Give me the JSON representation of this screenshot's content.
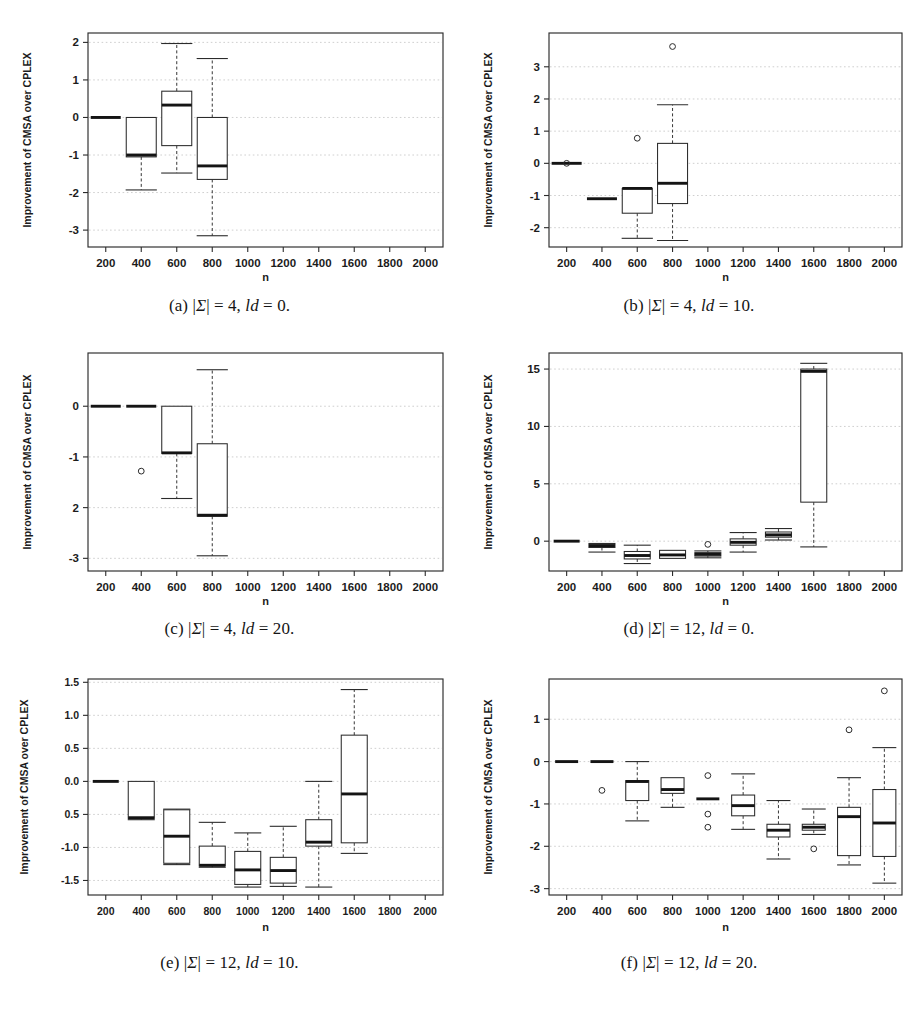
{
  "figure": {
    "y_axis_label": "Improvement of CMSA over CPLEX",
    "x_axis_label": "n",
    "panels": [
      {
        "id": "a",
        "caption_prefix": "(a)",
        "caption_body": "|Σ| = 4, ld = 0.",
        "alphabet": 4,
        "ld": 0,
        "ylabel": "Improvement of CMSA over CPLEX",
        "xlabel": "n",
        "yticks": [
          2,
          1,
          0,
          -1,
          -2,
          -3
        ],
        "yticklabels": [
          "2",
          "1",
          "0",
          "-1",
          "-2",
          "-3"
        ],
        "ylim": [
          -3.45,
          2.25
        ],
        "xticks": [
          200,
          400,
          600,
          800,
          1000,
          1200,
          1400,
          1600,
          1800,
          2000
        ],
        "xticklabels": [
          "200",
          "400",
          "600",
          "800",
          "1000",
          "1200",
          "1400",
          "1600",
          "1800",
          "2000"
        ]
      },
      {
        "id": "b",
        "caption_prefix": "(b)",
        "caption_body": "|Σ| = 4, ld = 10.",
        "alphabet": 4,
        "ld": 10,
        "ylabel": "Improvement of CMSA over CPLEX",
        "xlabel": "n",
        "yticks": [
          3,
          2,
          1,
          0,
          -1,
          -2
        ],
        "yticklabels": [
          "3",
          "2",
          "1",
          "0",
          "-1",
          "-2"
        ],
        "ylim": [
          -2.6,
          4.05
        ],
        "xticks": [
          200,
          400,
          600,
          800,
          1000,
          1200,
          1400,
          1600,
          1800,
          2000
        ],
        "xticklabels": [
          "200",
          "400",
          "600",
          "800",
          "1000",
          "1200",
          "1400",
          "1600",
          "1800",
          "2000"
        ]
      },
      {
        "id": "c",
        "caption_prefix": "(c)",
        "caption_body": "|Σ| = 4, ld = 20.",
        "alphabet": 4,
        "ld": 20,
        "ylabel": "Improvement of CMSA over CPLEX",
        "xlabel": "n",
        "yticks": [
          0,
          -1,
          -2,
          -3
        ],
        "yticklabels": [
          "0",
          "-1",
          "2",
          "-3"
        ],
        "ylim": [
          -3.25,
          1.05
        ],
        "xticks": [
          200,
          400,
          600,
          800,
          1000,
          1200,
          1400,
          1600,
          1800,
          2000
        ],
        "xticklabels": [
          "200",
          "400",
          "600",
          "800",
          "1000",
          "1200",
          "1400",
          "1600",
          "1800",
          "2000"
        ]
      },
      {
        "id": "d",
        "caption_prefix": "(d)",
        "caption_body": "|Σ| = 12, ld = 0.",
        "alphabet": 12,
        "ld": 0,
        "ylabel": "Improvement of CMSA over CPLEX",
        "xlabel": "n",
        "yticks": [
          15,
          10,
          5,
          0
        ],
        "yticklabels": [
          "15",
          "10",
          "5",
          "0"
        ],
        "ylim": [
          -2.6,
          16.4
        ],
        "xticks": [
          200,
          400,
          600,
          800,
          1000,
          1200,
          1400,
          1600,
          1800,
          2000
        ],
        "xticklabels": [
          "200",
          "400",
          "600",
          "800",
          "1000",
          "1200",
          "1400",
          "1600",
          "1800",
          "2000"
        ]
      },
      {
        "id": "e",
        "caption_prefix": "(e)",
        "caption_body": "|Σ| = 12, ld = 10.",
        "alphabet": 12,
        "ld": 10,
        "ylabel": "Improvement of CMSA over CPLEX",
        "xlabel": "n",
        "yticks": [
          1.5,
          1.0,
          0.5,
          0.0,
          -0.5,
          -1.0,
          -1.5
        ],
        "yticklabels": [
          "1.5",
          "1.0",
          "0.5",
          "0.0",
          "0.5",
          "-1.0",
          "-1.5"
        ],
        "ylim": [
          -1.72,
          1.55
        ],
        "xticks": [
          200,
          400,
          600,
          800,
          1000,
          1200,
          1400,
          1600,
          1800,
          2000
        ],
        "xticklabels": [
          "200",
          "400",
          "600",
          "800",
          "1000",
          "1200",
          "1400",
          "1600",
          "1800",
          "2000"
        ]
      },
      {
        "id": "f",
        "caption_prefix": "(f)",
        "caption_body": "|Σ| = 12, ld = 20.",
        "alphabet": 12,
        "ld": 20,
        "ylabel": "Improvement of CMSA over CPLEX",
        "xlabel": "n",
        "yticks": [
          1,
          0,
          -1,
          -2,
          -3
        ],
        "yticklabels": [
          "1",
          "0",
          "-1",
          "-2",
          "-3"
        ],
        "ylim": [
          -3.15,
          1.95
        ],
        "xticks": [
          200,
          400,
          600,
          800,
          1000,
          1200,
          1400,
          1600,
          1800,
          2000
        ],
        "xticklabels": [
          "200",
          "400",
          "600",
          "800",
          "1000",
          "1200",
          "1400",
          "1600",
          "1800",
          "2000"
        ]
      }
    ]
  },
  "chart_data": [
    {
      "type": "box",
      "panel": "a",
      "title": "(a) |Σ| = 4, ld = 0.",
      "xlabel": "n",
      "ylabel": "Improvement of CMSA over CPLEX",
      "ylim": [
        -3.45,
        2.25
      ],
      "xlim": [
        100,
        2100
      ],
      "grid": true,
      "categories": [
        200,
        400,
        600,
        800
      ],
      "boxes": [
        {
          "x": 200,
          "whisker_low": 0.0,
          "q1": 0.0,
          "median": 0.0,
          "q3": 0.0,
          "whisker_high": 0.0,
          "outliers": []
        },
        {
          "x": 400,
          "whisker_low": -1.93,
          "q1": -1.05,
          "median": -1.0,
          "q3": 0.0,
          "whisker_high": 0.0,
          "outliers": []
        },
        {
          "x": 600,
          "whisker_low": -1.48,
          "q1": -0.75,
          "median": 0.33,
          "q3": 0.7,
          "whisker_high": 1.97,
          "outliers": []
        },
        {
          "x": 800,
          "whisker_low": -3.15,
          "q1": -1.65,
          "median": -1.29,
          "q3": 0.0,
          "whisker_high": 1.57,
          "outliers": []
        }
      ]
    },
    {
      "type": "box",
      "panel": "b",
      "title": "(b) |Σ| = 4, ld = 10.",
      "xlabel": "n",
      "ylabel": "Improvement of CMSA over CPLEX",
      "ylim": [
        -2.6,
        4.05
      ],
      "xlim": [
        100,
        2100
      ],
      "grid": true,
      "categories": [
        200,
        400,
        600,
        800
      ],
      "boxes": [
        {
          "x": 200,
          "whisker_low": 0.0,
          "q1": 0.0,
          "median": 0.0,
          "q3": 0.0,
          "whisker_high": 0.0,
          "outliers": [
            0.0
          ]
        },
        {
          "x": 400,
          "whisker_low": -1.1,
          "q1": -1.1,
          "median": -1.1,
          "q3": -1.1,
          "whisker_high": -1.1,
          "outliers": []
        },
        {
          "x": 600,
          "whisker_low": -2.33,
          "q1": -1.55,
          "median": -0.78,
          "q3": -0.78,
          "whisker_high": -0.78,
          "outliers": [
            0.78
          ]
        },
        {
          "x": 800,
          "whisker_low": -2.4,
          "q1": -1.25,
          "median": -0.62,
          "q3": 0.62,
          "whisker_high": 1.82,
          "outliers": [
            3.63
          ]
        }
      ]
    },
    {
      "type": "box",
      "panel": "c",
      "title": "(c) |Σ| = 4, ld = 20.",
      "xlabel": "n",
      "ylabel": "Improvement of CMSA over CPLEX",
      "ylim": [
        -3.25,
        1.05
      ],
      "xlim": [
        100,
        2100
      ],
      "grid": true,
      "categories": [
        200,
        400,
        600,
        800
      ],
      "boxes": [
        {
          "x": 200,
          "whisker_low": 0.0,
          "q1": 0.0,
          "median": 0.0,
          "q3": 0.0,
          "whisker_high": 0.0,
          "outliers": []
        },
        {
          "x": 400,
          "whisker_low": 0.0,
          "q1": 0.0,
          "median": 0.0,
          "q3": 0.0,
          "whisker_high": 0.0,
          "outliers": [
            -1.28
          ]
        },
        {
          "x": 600,
          "whisker_low": -1.82,
          "q1": -0.93,
          "median": -0.92,
          "q3": 0.0,
          "whisker_high": 0.0,
          "outliers": []
        },
        {
          "x": 800,
          "whisker_low": -2.95,
          "q1": -2.17,
          "median": -2.15,
          "q3": -0.74,
          "whisker_high": 0.72,
          "outliers": []
        }
      ]
    },
    {
      "type": "box",
      "panel": "d",
      "title": "(d) |Σ| = 12, ld = 0.",
      "xlabel": "n",
      "ylabel": "Improvement of CMSA over CPLEX",
      "ylim": [
        -2.6,
        16.4
      ],
      "xlim": [
        100,
        2100
      ],
      "grid": true,
      "categories": [
        200,
        400,
        600,
        800,
        1000,
        1200,
        1400,
        1600
      ],
      "boxes": [
        {
          "x": 200,
          "whisker_low": 0.0,
          "q1": 0.0,
          "median": 0.0,
          "q3": 0.0,
          "whisker_high": 0.0,
          "outliers": []
        },
        {
          "x": 400,
          "whisker_low": -0.95,
          "q1": -0.55,
          "median": -0.38,
          "q3": -0.2,
          "whisker_high": -0.2,
          "outliers": []
        },
        {
          "x": 600,
          "whisker_low": -1.95,
          "q1": -1.55,
          "median": -1.25,
          "q3": -0.9,
          "whisker_high": -0.35,
          "outliers": []
        },
        {
          "x": 800,
          "whisker_low": -1.55,
          "q1": -1.5,
          "median": -1.2,
          "q3": -0.8,
          "whisker_high": -0.8,
          "outliers": []
        },
        {
          "x": 1000,
          "whisker_low": -1.45,
          "q1": -1.3,
          "median": -1.15,
          "q3": -1.0,
          "whisker_high": -0.85,
          "outliers": [
            -0.28
          ]
        },
        {
          "x": 1200,
          "whisker_low": -0.95,
          "q1": -0.35,
          "median": -0.1,
          "q3": 0.2,
          "whisker_high": 0.75,
          "outliers": []
        },
        {
          "x": 1400,
          "whisker_low": 0.1,
          "q1": 0.35,
          "median": 0.55,
          "q3": 0.8,
          "whisker_high": 1.1,
          "outliers": []
        },
        {
          "x": 1600,
          "whisker_low": -0.5,
          "q1": 3.4,
          "median": 14.8,
          "q3": 15.0,
          "whisker_high": 15.5,
          "outliers": []
        }
      ]
    },
    {
      "type": "box",
      "panel": "e",
      "title": "(e) |Σ| = 12, ld = 10.",
      "xlabel": "n",
      "ylabel": "Improvement of CMSA over CPLEX",
      "ylim": [
        -1.72,
        1.55
      ],
      "xlim": [
        100,
        2100
      ],
      "grid": true,
      "categories": [
        200,
        400,
        600,
        800,
        1000,
        1200,
        1400,
        1600
      ],
      "boxes": [
        {
          "x": 200,
          "whisker_low": 0.0,
          "q1": 0.0,
          "median": 0.0,
          "q3": 0.0,
          "whisker_high": 0.0,
          "outliers": []
        },
        {
          "x": 400,
          "whisker_low": -0.58,
          "q1": -0.56,
          "median": -0.55,
          "q3": 0.0,
          "whisker_high": 0.0,
          "outliers": []
        },
        {
          "x": 600,
          "whisker_low": -1.26,
          "q1": -1.24,
          "median": -0.83,
          "q3": -0.43,
          "whisker_high": -0.42,
          "outliers": []
        },
        {
          "x": 800,
          "whisker_low": -1.3,
          "q1": -1.28,
          "median": -1.27,
          "q3": -0.98,
          "whisker_high": -0.62,
          "outliers": []
        },
        {
          "x": 1000,
          "whisker_low": -1.6,
          "q1": -1.56,
          "median": -1.34,
          "q3": -1.06,
          "whisker_high": -0.78,
          "outliers": []
        },
        {
          "x": 1200,
          "whisker_low": -1.59,
          "q1": -1.54,
          "median": -1.35,
          "q3": -1.15,
          "whisker_high": -0.68,
          "outliers": []
        },
        {
          "x": 1400,
          "whisker_low": -1.6,
          "q1": -0.98,
          "median": -0.92,
          "q3": -0.58,
          "whisker_high": 0.0,
          "outliers": []
        },
        {
          "x": 1600,
          "whisker_low": -1.09,
          "q1": -0.93,
          "median": -0.19,
          "q3": 0.7,
          "whisker_high": 1.39,
          "outliers": []
        }
      ]
    },
    {
      "type": "box",
      "panel": "f",
      "title": "(f) |Σ| = 12, ld = 20.",
      "xlabel": "n",
      "ylabel": "Improvement of CMSA over CPLEX",
      "ylim": [
        -3.15,
        1.95
      ],
      "xlim": [
        100,
        2100
      ],
      "grid": true,
      "categories": [
        200,
        400,
        600,
        800,
        1000,
        1200,
        1400,
        1600,
        1800,
        2000
      ],
      "boxes": [
        {
          "x": 200,
          "whisker_low": 0.0,
          "q1": 0.0,
          "median": 0.0,
          "q3": 0.0,
          "whisker_high": 0.0,
          "outliers": []
        },
        {
          "x": 400,
          "whisker_low": 0.0,
          "q1": 0.0,
          "median": 0.0,
          "q3": 0.0,
          "whisker_high": 0.0,
          "outliers": [
            -0.68
          ]
        },
        {
          "x": 600,
          "whisker_low": -1.4,
          "q1": -0.92,
          "median": -0.47,
          "q3": -0.45,
          "whisker_high": 0.0,
          "outliers": []
        },
        {
          "x": 800,
          "whisker_low": -1.08,
          "q1": -0.75,
          "median": -0.66,
          "q3": -0.38,
          "whisker_high": -0.38,
          "outliers": []
        },
        {
          "x": 1000,
          "whisker_low": -0.88,
          "q1": -0.88,
          "median": -0.88,
          "q3": -0.88,
          "whisker_high": -0.88,
          "outliers": [
            -0.33,
            -1.24,
            -1.55
          ]
        },
        {
          "x": 1200,
          "whisker_low": -1.6,
          "q1": -1.28,
          "median": -1.04,
          "q3": -0.79,
          "whisker_high": -0.29,
          "outliers": []
        },
        {
          "x": 1400,
          "whisker_low": -2.3,
          "q1": -1.78,
          "median": -1.62,
          "q3": -1.48,
          "whisker_high": -0.92,
          "outliers": []
        },
        {
          "x": 1600,
          "whisker_low": -1.72,
          "q1": -1.62,
          "median": -1.55,
          "q3": -1.48,
          "whisker_high": -1.12,
          "outliers": [
            -2.06
          ]
        },
        {
          "x": 1800,
          "whisker_low": -2.44,
          "q1": -2.22,
          "median": -1.3,
          "q3": -1.08,
          "whisker_high": -0.38,
          "outliers": [
            0.75
          ]
        },
        {
          "x": 2000,
          "whisker_low": -2.87,
          "q1": -2.24,
          "median": -1.45,
          "q3": -0.66,
          "whisker_high": 0.33,
          "outliers": [
            1.67
          ]
        }
      ]
    }
  ]
}
